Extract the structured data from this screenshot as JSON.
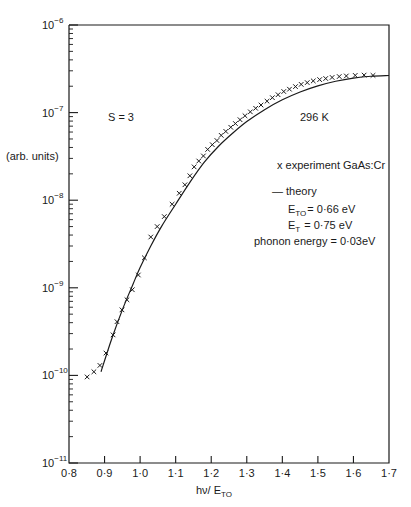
{
  "chart_data": {
    "type": "scatter",
    "title": "",
    "xlabel": "hν / E_TO",
    "ylabel": "(arb. units)",
    "xlim": [
      0.8,
      1.7
    ],
    "ylim": [
      1e-11,
      1e-06
    ],
    "yscale": "log",
    "grid": false,
    "x_ticks": [
      "0·8",
      "0·9",
      "1·0",
      "1·1",
      "1·2",
      "1·3",
      "1·4",
      "1·5",
      "1·6",
      "1·7"
    ],
    "y_ticks": [
      "10^-11",
      "10^-10",
      "10^-9",
      "10^-8",
      "10^-7",
      "10^-6"
    ],
    "annotations": [
      "S = 3",
      "296 K"
    ],
    "legend": {
      "position": "right-middle",
      "entries": [
        {
          "marker": "x",
          "label": "experiment GaAs:Cr"
        },
        {
          "marker": "line",
          "label": "theory"
        }
      ],
      "params": [
        "E_TO = 0·66 eV",
        "E_T = 0·75 eV",
        "phonon energy = 0·03eV"
      ]
    },
    "series": [
      {
        "name": "experiment GaAs:Cr",
        "marker": "x",
        "x": [
          0.851,
          0.87,
          0.887,
          0.904,
          0.924,
          0.935,
          0.949,
          0.963,
          0.978,
          0.995,
          1.012,
          1.03,
          1.048,
          1.068,
          1.09,
          1.11,
          1.126,
          1.14,
          1.152,
          1.165,
          1.178,
          1.19,
          1.203,
          1.216,
          1.228,
          1.241,
          1.255,
          1.268,
          1.281,
          1.295,
          1.31,
          1.325,
          1.34,
          1.357,
          1.372,
          1.388,
          1.404,
          1.42,
          1.437,
          1.453,
          1.47,
          1.487,
          1.505,
          1.522,
          1.54,
          1.56,
          1.58,
          1.605,
          1.63,
          1.655
        ],
        "y": [
          9.6e-11,
          1.1e-10,
          1.3e-10,
          1.8e-10,
          2.9e-10,
          4.1e-10,
          5.6e-10,
          7.3e-10,
          9.5e-10,
          1.4e-09,
          2.2e-09,
          3.8e-09,
          5e-09,
          6.5e-09,
          9e-09,
          1.2e-08,
          1.5e-08,
          1.9e-08,
          2.4e-08,
          2.8e-08,
          3.2e-08,
          3.8e-08,
          4.3e-08,
          4.8e-08,
          5.5e-08,
          6.1e-08,
          6.8e-08,
          7.5e-08,
          8.3e-08,
          9.2e-08,
          1.02e-07,
          1.12e-07,
          1.22e-07,
          1.35e-07,
          1.48e-07,
          1.6e-07,
          1.74e-07,
          1.85e-07,
          1.98e-07,
          2.1e-07,
          2.2e-07,
          2.3e-07,
          2.38e-07,
          2.45e-07,
          2.52e-07,
          2.58e-07,
          2.62e-07,
          2.66e-07,
          2.68e-07,
          2.66e-07
        ]
      },
      {
        "name": "theory",
        "marker": "line",
        "x": [
          0.89,
          0.92,
          0.95,
          0.98,
          1.0,
          1.03,
          1.06,
          1.1,
          1.14,
          1.18,
          1.22,
          1.26,
          1.3,
          1.35,
          1.4,
          1.45,
          1.5,
          1.55,
          1.6,
          1.65,
          1.7
        ],
        "y": [
          1.1e-10,
          2.6e-10,
          5.6e-10,
          1.1e-09,
          1.7e-09,
          3e-09,
          5e-09,
          9e-09,
          1.6e-08,
          2.7e-08,
          4.1e-08,
          5.8e-08,
          7.9e-08,
          1.08e-07,
          1.4e-07,
          1.72e-07,
          2.02e-07,
          2.28e-07,
          2.48e-07,
          2.6e-07,
          2.65e-07
        ]
      }
    ]
  },
  "labels": {
    "ylabel": "(arb. units)",
    "xlabel_main": "hν/ E",
    "xlabel_sub": "TO",
    "s_label": "S = 3",
    "temp_label": "296 K",
    "legend_exp": "x  experiment GaAs:Cr",
    "legend_theory": "— theory",
    "eto_main": "E",
    "eto_sub": "TO",
    "eto_val": "= 0·66 eV",
    "et_main": "E",
    "et_sub": "T",
    "et_val": "= 0·75 eV",
    "phonon": "phonon energy = 0·03eV"
  }
}
